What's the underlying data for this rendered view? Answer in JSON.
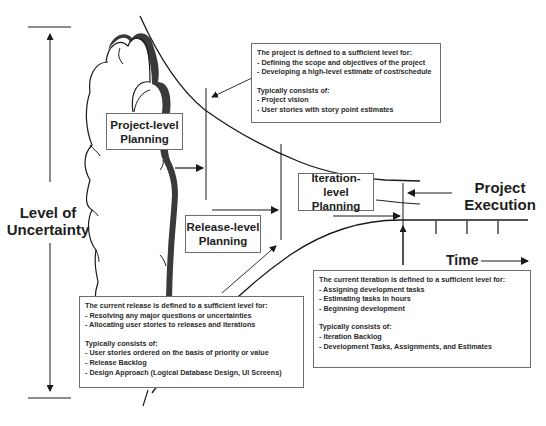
{
  "diagram": {
    "axis": {
      "label_line1": "Level of",
      "label_line2": "Uncertainty"
    },
    "stages": [
      {
        "id": "project",
        "line1": "Project-level",
        "line2": "Planning"
      },
      {
        "id": "release",
        "line1": "Release-level",
        "line2": "Planning"
      },
      {
        "id": "iteration",
        "line1": "Iteration-level",
        "line2": "Planning"
      }
    ],
    "execution": {
      "line1": "Project",
      "line2": "Execution"
    },
    "time_label": "Time",
    "notes": {
      "project": {
        "heading": "The project is defined to a sufficient level for:",
        "bullets": [
          "- Defining the scope and objectives of the project",
          "- Developing a high-level estimate of cost/schedule"
        ],
        "consists_heading": "Typically consists of:",
        "consists": [
          "- Project vision",
          "- User stories with story point estimates"
        ]
      },
      "release": {
        "heading": "The current release is defined to a sufficient level for:",
        "bullets": [
          "- Resolving any major questions or uncertainties",
          "- Allocating user stories to releases and iterations"
        ],
        "consists_heading": "Typically consists of:",
        "consists": [
          "- User stories ordered on the basis of priority or value",
          "- Release Backlog",
          "- Design Approach (Logical Database Design, UI Screens)"
        ]
      },
      "iteration": {
        "heading": "The current iteration is defined to a sufficient level for:",
        "bullets": [
          "- Assigning development tasks",
          "- Estimating tasks in hours",
          "- Beginning development"
        ],
        "consists_heading": "Typically consists of:",
        "consists": [
          "- Iteration Backlog",
          "- Development Tasks, Assignments, and Estimates"
        ]
      }
    },
    "colors": {
      "line": "#1a1a1a",
      "cloud_shadow": "#3a3a3a",
      "box_border": "#6e6e6e",
      "background": "#ffffff"
    }
  }
}
